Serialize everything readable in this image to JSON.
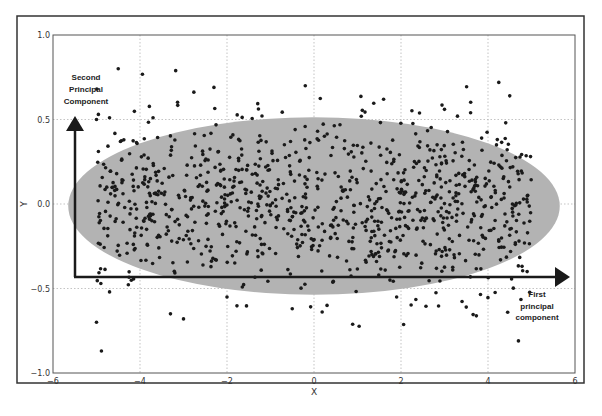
{
  "chart_data": {
    "type": "scatter",
    "title": "",
    "xlabel": "X",
    "ylabel": "Y",
    "xlim": [
      -6,
      6
    ],
    "ylim": [
      -1.0,
      1.0
    ],
    "xticks": [
      -6,
      -4,
      -2,
      0,
      2,
      4,
      6
    ],
    "xtick_labels": [
      "−6",
      "−4",
      "−2",
      "0",
      "2",
      "4",
      "6"
    ],
    "yticks": [
      -1.0,
      -0.5,
      0.0,
      0.5,
      1.0
    ],
    "ytick_labels": [
      "−1.0",
      "−0.5",
      "0.0",
      "0.5",
      "1.0"
    ],
    "grid": true,
    "legend": null,
    "point_count_approx": 1000,
    "distribution": "uniform x in [-5, 5], gaussian y with mean 0 and std ~0.25",
    "ellipse": {
      "center": [
        0.0,
        0.0
      ],
      "width_x": 11.3,
      "height_y": 1.05,
      "fill": "#b3b3b3"
    },
    "annotations": [
      {
        "text": [
          "Second",
          "Principal",
          "Component"
        ],
        "type": "arrow",
        "direction": "up",
        "from": [
          -5.0,
          -0.35
        ],
        "to": [
          -5.0,
          0.5
        ]
      },
      {
        "text": [
          "First",
          "principal",
          "component"
        ],
        "type": "arrow",
        "direction": "right",
        "from": [
          -5.0,
          -0.35
        ],
        "to": [
          5.8,
          -0.35
        ]
      }
    ],
    "sample_points": [
      [
        -4.5,
        0.8
      ],
      [
        -0.2,
        0.7
      ],
      [
        1.6,
        0.62
      ],
      [
        4.5,
        0.64
      ],
      [
        -5.0,
        0.5
      ],
      [
        -4.7,
        0.51
      ],
      [
        -2.3,
        0.69
      ],
      [
        -3.7,
        0.51
      ],
      [
        3.0,
        0.56
      ],
      [
        3.6,
        0.54
      ],
      [
        -5.0,
        -0.7
      ],
      [
        -3.3,
        -0.65
      ],
      [
        -3.0,
        -0.68
      ],
      [
        -0.5,
        -0.62
      ],
      [
        0.3,
        -0.6
      ],
      [
        3.5,
        -0.61
      ],
      [
        4.7,
        -0.81
      ],
      [
        -4.9,
        -0.47
      ],
      [
        -4.7,
        -0.52
      ],
      [
        -2.0,
        -0.55
      ],
      [
        1.9,
        -0.55
      ],
      [
        4.9,
        -0.4
      ]
    ]
  }
}
